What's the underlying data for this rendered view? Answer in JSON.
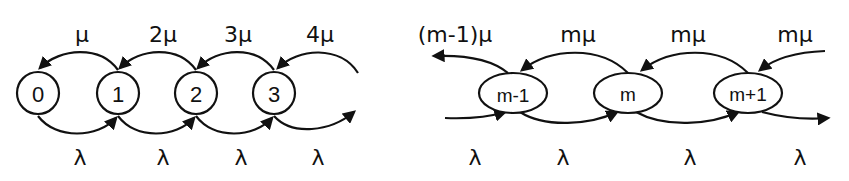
{
  "left_diagram": {
    "nodes": [
      {
        "id": "0",
        "label": "0",
        "cx": 38,
        "cy": 93
      },
      {
        "id": "1",
        "label": "1",
        "cx": 118,
        "cy": 93
      },
      {
        "id": "2",
        "label": "2",
        "cx": 196,
        "cy": 93
      },
      {
        "id": "3",
        "label": "3",
        "cx": 274,
        "cy": 93
      }
    ],
    "death_rates": [
      {
        "label": "μ",
        "x": 82
      },
      {
        "label": "2μ",
        "x": 163
      },
      {
        "label": "3μ",
        "x": 238
      },
      {
        "label": "4μ",
        "x": 320
      }
    ],
    "birth_rates": [
      {
        "label": "λ",
        "x": 80
      },
      {
        "label": "λ",
        "x": 163
      },
      {
        "label": "λ",
        "x": 241
      },
      {
        "label": "λ",
        "x": 318
      }
    ]
  },
  "right_diagram": {
    "nodes": [
      {
        "id": "m-1",
        "label": "m-1",
        "cx": 513,
        "cy": 93
      },
      {
        "id": "m",
        "label": "m",
        "cx": 628,
        "cy": 93
      },
      {
        "id": "m+1",
        "label": "m+1",
        "cx": 748,
        "cy": 93
      }
    ],
    "death_rates": [
      {
        "label": "(m-1)μ",
        "x": 455
      },
      {
        "label": "mμ",
        "x": 578
      },
      {
        "label": "mμ",
        "x": 688
      },
      {
        "label": "mμ",
        "x": 795
      }
    ],
    "birth_rates": [
      {
        "label": "λ",
        "x": 475
      },
      {
        "label": "λ",
        "x": 563
      },
      {
        "label": "λ",
        "x": 690
      },
      {
        "label": "λ",
        "x": 800
      }
    ]
  }
}
